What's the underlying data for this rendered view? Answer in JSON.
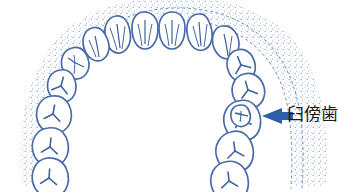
{
  "figure": {
    "view": "maxillary occlusal view",
    "background_color": "#ffffff"
  },
  "colors": {
    "tooth_outline": "#4a6ba8",
    "tooth_detail": "#3f62a3",
    "stipple": "#6d8cc0",
    "arrow": "#2d5fa8",
    "label_text": "#1a1a1a"
  },
  "annotation": {
    "arrow_icon": "left-arrow-icon",
    "arrow_direction": "left",
    "label": "臼傍歯"
  },
  "arch": {
    "teeth_left_count": 8,
    "teeth_right_count": 8,
    "supernumerary_tooth": "paramolar",
    "supernumerary_position": "buccal to right molars"
  }
}
